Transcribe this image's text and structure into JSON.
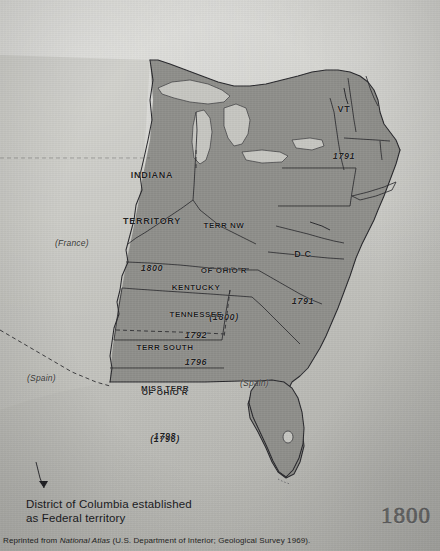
{
  "figure": {
    "title_year": "1800",
    "caption_line_1": "District of Columbia established",
    "caption_line_2": "as Federal territory",
    "credit_prefix": "Reprinted from ",
    "credit_italic": "National Atlas",
    "credit_suffix": " (U.S. Department of Interior; Geological Survey 1969)."
  },
  "map": {
    "labels": [
      {
        "id": "indiana-territory",
        "name_line_1": "INDIANA",
        "name_line_2": "TERRITORY",
        "year": "1800"
      },
      {
        "id": "terr-nw-of-ohio-r",
        "name_line_1": "TERR NW",
        "name_line_2": "OF OHIO R",
        "year": "(1800)"
      },
      {
        "id": "kentucky",
        "name_line_1": "KENTUCKY",
        "year": "1792"
      },
      {
        "id": "tennessee",
        "name_line_1": "TENNESSEE",
        "year": "1796"
      },
      {
        "id": "terr-south-of-ohio-r",
        "name_line_1": "TERR SOUTH",
        "name_line_2": "OF OHIO R",
        "year": "(1796)"
      },
      {
        "id": "mississippi-territory",
        "name_line_1": "MISS TERR",
        "year": "1798"
      },
      {
        "id": "vermont",
        "name_line_1": "VT",
        "year": "1791"
      },
      {
        "id": "district-of-columbia",
        "name_line_1": "D C",
        "year": "1791"
      }
    ],
    "foreign_claims": [
      {
        "id": "louisiana-france",
        "label": "(France)"
      },
      {
        "id": "spanish-west",
        "label": "(Spain)"
      },
      {
        "id": "spanish-florida",
        "label": "(Spain)"
      }
    ],
    "colors": {
      "paper": "#c9c9c4",
      "land_shaded": "#8e8e8a",
      "land_light": "#bcbcb7",
      "water": "#c3c3be",
      "outline": "#26262a",
      "ink": "#1b1b1b"
    }
  }
}
